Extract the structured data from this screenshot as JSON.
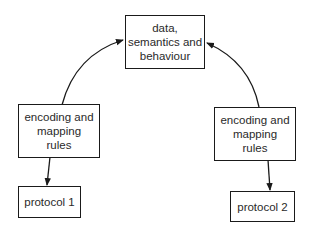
{
  "diagram": {
    "nodes": {
      "core": {
        "lines": [
          "data,",
          "semantics and",
          "behaviour"
        ]
      },
      "left_rules": {
        "lines": [
          "encoding and",
          "mapping",
          "rules"
        ]
      },
      "right_rules": {
        "lines": [
          "encoding and",
          "mapping",
          "rules"
        ]
      },
      "protocol1": {
        "label": "protocol 1"
      },
      "protocol2": {
        "label": "protocol 2"
      }
    },
    "edges": [
      {
        "from": "left_rules",
        "to": "core",
        "style": "curved-arrow"
      },
      {
        "from": "right_rules",
        "to": "core",
        "style": "curved-arrow"
      },
      {
        "from": "left_rules",
        "to": "protocol1",
        "style": "straight-arrow"
      },
      {
        "from": "right_rules",
        "to": "protocol2",
        "style": "straight-arrow"
      }
    ],
    "colors": {
      "stroke": "#1a1a1a",
      "text": "#2a2a2a",
      "background": "#ffffff"
    }
  }
}
